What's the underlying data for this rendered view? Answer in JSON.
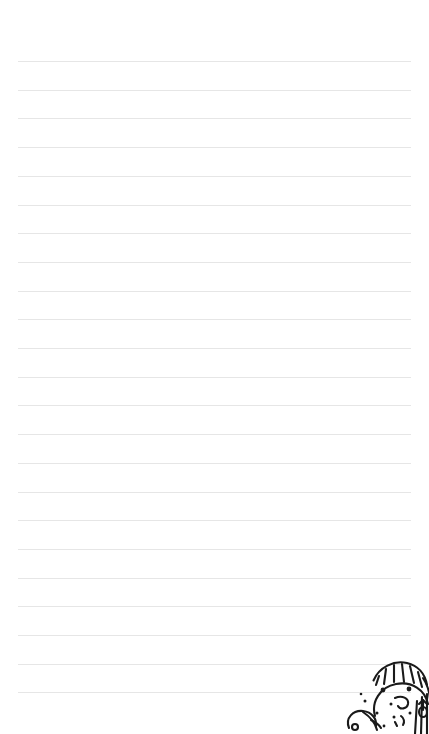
{
  "page": {
    "kind": "ruled-notepaper",
    "background_color": "#ffffff",
    "width_px": 429,
    "height_px": 734,
    "written_text": ""
  },
  "ruling": {
    "line_color": "#e6e6e6",
    "line_count": 23,
    "first_line_y": 61,
    "line_spacing_px": 28.7,
    "line_left_x": 18,
    "line_right_x": 411,
    "line_thickness_px": 1,
    "top_margin_px": 61,
    "label": "Ruled writing lines"
  },
  "doodle": {
    "label": "Hand-drawn cartoon doodle",
    "description": "Black line-art character with fringe hair and dot eyes",
    "ink_color": "#1a1a1a",
    "position": "bottom-right",
    "stroke_width": 2.1
  }
}
